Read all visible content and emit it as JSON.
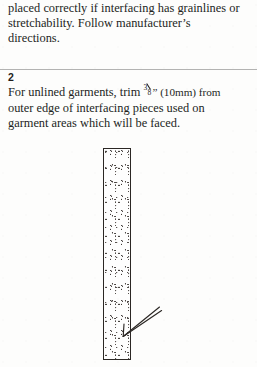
{
  "page": {
    "background_color": "#fdfdfc",
    "text_color": "#231f1d",
    "rule_color": "#9a9a9a"
  },
  "continued_paragraph": {
    "lines": [
      "placed correctly if interfacing has grainlines or",
      "stretchability. Follow manufacturer’s",
      "directions."
    ]
  },
  "step": {
    "number": "2",
    "lines": {
      "line1_before": "For unlined garments, trim ",
      "fraction_numerator": "3",
      "fraction_denominator": "8",
      "line1_after": "” (10mm) from",
      "line2": "outer edge of interfacing pieces used on",
      "line3": "garment areas which will be faced."
    }
  },
  "figure": {
    "caption": "",
    "strip_label": "interfacing-strip",
    "arrow_label": "trim-edge-pointer"
  }
}
